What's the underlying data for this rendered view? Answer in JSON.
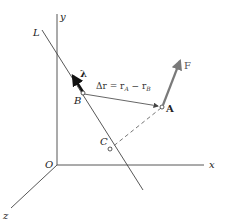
{
  "diagram": {
    "axes": {
      "x_label": "x",
      "y_label": "y",
      "z_label": "z",
      "origin_label": "O"
    },
    "line": {
      "label": "L"
    },
    "unit_vector": {
      "label": "λ"
    },
    "points": {
      "A": "A",
      "B": "B",
      "C": "C"
    },
    "force": {
      "label": "F"
    },
    "position_vector": {
      "lhs": "Δr = r",
      "sub_A": "A",
      "minus": " − r",
      "sub_B": "B"
    },
    "colors": {
      "axes": "#333333",
      "force_arrow": "#7a7a7a",
      "unit_vector": "#111111",
      "dashed": "#666666"
    }
  }
}
